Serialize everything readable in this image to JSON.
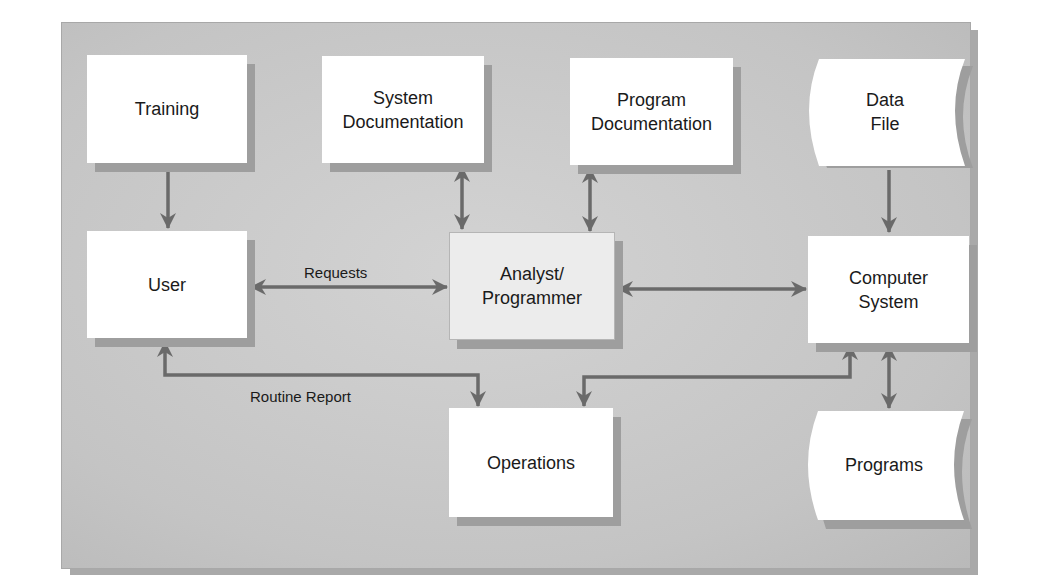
{
  "diagram": {
    "nodes": {
      "training": {
        "label": "Training",
        "shape": "rectangle"
      },
      "system_documentation": {
        "label": "System\nDocumentation",
        "shape": "rectangle"
      },
      "program_documentation": {
        "label": "Program\nDocumentation",
        "shape": "rectangle"
      },
      "data_file": {
        "label": "Data\nFile",
        "shape": "stored-data"
      },
      "user": {
        "label": "User",
        "shape": "rectangle"
      },
      "analyst_programmer": {
        "label": "Analyst/\nProgrammer",
        "shape": "rectangle"
      },
      "computer_system": {
        "label": "Computer\nSystem",
        "shape": "rectangle"
      },
      "operations": {
        "label": "Operations",
        "shape": "rectangle"
      },
      "programs": {
        "label": "Programs",
        "shape": "stored-data"
      }
    },
    "edge_labels": {
      "requests": "Requests",
      "routine_report": "Routine Report"
    },
    "edges": [
      {
        "from": "Training",
        "to": "User",
        "direction": "one-way"
      },
      {
        "from": "System Documentation",
        "to": "Analyst/Programmer",
        "direction": "two-way"
      },
      {
        "from": "Program Documentation",
        "to": "Analyst/Programmer",
        "direction": "two-way"
      },
      {
        "from": "Data File",
        "to": "Computer System",
        "direction": "one-way"
      },
      {
        "from": "User",
        "to": "Analyst/Programmer",
        "direction": "two-way",
        "label": "Requests"
      },
      {
        "from": "Analyst/Programmer",
        "to": "Computer System",
        "direction": "two-way"
      },
      {
        "from": "User",
        "to": "Operations",
        "direction": "two-way",
        "label": "Routine Report"
      },
      {
        "from": "Operations",
        "to": "Computer System",
        "direction": "two-way"
      },
      {
        "from": "Computer System",
        "to": "Programs",
        "direction": "two-way"
      }
    ],
    "colors": {
      "background_panel": "#c9c9c9",
      "box_fill": "#ffffff",
      "box_shadow": "#9e9e9e",
      "arrow": "#6a6a6a",
      "text": "#1a1a1a"
    }
  }
}
